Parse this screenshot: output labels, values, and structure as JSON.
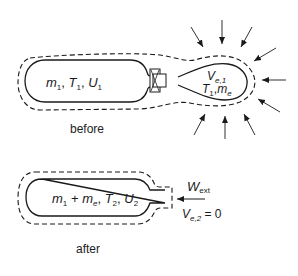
{
  "before": {
    "tank_label": {
      "m": "m",
      "m_sub": "1",
      "T": "T",
      "T_sub": "1",
      "U": "U",
      "U_sub": "1"
    },
    "bag_label": {
      "V": "V",
      "V_sub": "e,1",
      "T": "T",
      "T_sub": "1",
      "m": "m",
      "m_sub": "e"
    },
    "caption": "before"
  },
  "after": {
    "tank_label": {
      "m1": "m",
      "m1_sub": "1",
      "plus": " + ",
      "me": "m",
      "me_sub": "e",
      "T": "T",
      "T_sub": "2",
      "U": "U",
      "U_sub": "2"
    },
    "work_label": {
      "W": "W",
      "W_sub": "ext"
    },
    "volume_label": {
      "V": "V",
      "V_sub": "e,2",
      "eq": " = 0"
    },
    "caption": "after"
  },
  "colors": {
    "line": "#1a1a1a",
    "background": "#ffffff"
  }
}
